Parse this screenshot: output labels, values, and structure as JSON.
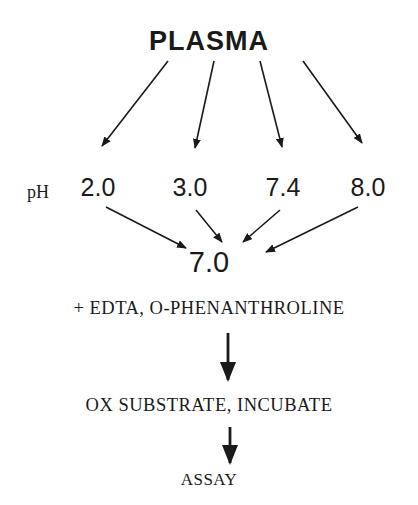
{
  "diagram": {
    "source_node": "PLASMA",
    "ph_label": "pH",
    "ph_values": [
      "2.0",
      "3.0",
      "7.4",
      "8.0"
    ],
    "target_ph": "7.0",
    "steps": [
      "+ EDTA, O-PHENANTHROLINE",
      "OX SUBSTRATE, INCUBATE",
      "ASSAY"
    ],
    "colors": {
      "ink": "#1a1a1a",
      "background": "#ffffff"
    }
  }
}
